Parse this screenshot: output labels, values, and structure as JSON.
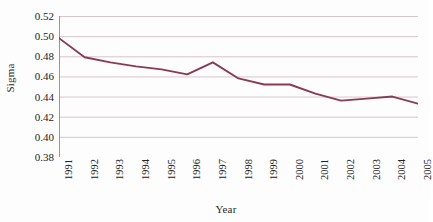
{
  "chart_data": {
    "type": "line",
    "title": "",
    "xlabel": "Year",
    "ylabel": "Sigma",
    "categories": [
      "1991",
      "1992",
      "1993",
      "1994",
      "1995",
      "1996",
      "1997",
      "1998",
      "1999",
      "2000",
      "2001",
      "2002",
      "2003",
      "2004",
      "2005"
    ],
    "values": [
      0.498,
      0.479,
      0.474,
      0.47,
      0.467,
      0.462,
      0.474,
      0.458,
      0.452,
      0.452,
      0.443,
      0.436,
      0.438,
      0.44,
      0.433
    ],
    "series": [
      {
        "name": "Sigma",
        "values": [
          0.498,
          0.479,
          0.474,
          0.47,
          0.467,
          0.462,
          0.474,
          0.458,
          0.452,
          0.452,
          0.443,
          0.436,
          0.438,
          0.44,
          0.433
        ]
      }
    ],
    "ylim": [
      0.38,
      0.52
    ],
    "ytick_step": 0.02,
    "ytick_labels": [
      "0.52",
      "0.50",
      "0.48",
      "0.46",
      "0.44",
      "0.42",
      "0.40",
      "0.38"
    ],
    "ytick_values": [
      0.52,
      0.5,
      0.48,
      0.46,
      0.44,
      0.42,
      0.4,
      0.38
    ],
    "grid": "horizontal",
    "legend": "none",
    "line_color": "#8a3a52",
    "grid_color": "#d9c4cc",
    "axis_color": "#b08a96",
    "background": "#ffffff",
    "markers": "none"
  }
}
